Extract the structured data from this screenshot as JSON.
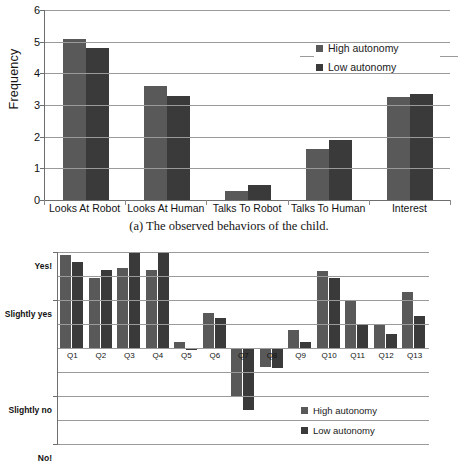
{
  "figure_a": {
    "caption": "(a) The observed behaviors of the child.",
    "ylabel": "Frequency",
    "yticks": [
      "6",
      "5",
      "4",
      "3",
      "2",
      "1",
      "0"
    ],
    "legend": [
      {
        "label": "High autonomy",
        "key": "high"
      },
      {
        "label": "Low autonomy",
        "key": "low"
      }
    ]
  },
  "figure_b": {
    "caption": "(b) The children’s answers on the questionnaire.",
    "yticks": [
      "Yes!",
      "Slightly yes",
      "Slightly no",
      "No!"
    ],
    "legend": [
      {
        "label": "High autonomy",
        "key": "high"
      },
      {
        "label": "Low autonomy",
        "key": "low"
      }
    ]
  },
  "chart_data": [
    {
      "type": "bar",
      "id": "observed-behaviors",
      "title": "(a) The observed behaviors of the child.",
      "xlabel": "",
      "ylabel": "Frequency",
      "ylim": [
        0,
        6
      ],
      "yticks": [
        0,
        1,
        2,
        3,
        4,
        5,
        6
      ],
      "grid": true,
      "legend_position": "top-right",
      "categories": [
        "Looks At Robot",
        "Looks At Human",
        "Talks To Robot",
        "Talks To Human",
        "Interest"
      ],
      "series": [
        {
          "name": "High autonomy",
          "color": "#595959",
          "values": [
            5.1,
            3.6,
            0.3,
            1.6,
            3.25
          ]
        },
        {
          "name": "Low autonomy",
          "color": "#3a3a3a",
          "values": [
            4.8,
            3.3,
            0.47,
            1.9,
            3.35
          ]
        }
      ]
    },
    {
      "type": "bar",
      "id": "questionnaire-answers",
      "title": "(b) The children’s answers on the questionnaire.",
      "xlabel": "",
      "ylabel": "",
      "ylim": [
        -3,
        3
      ],
      "ytick_values": [
        3,
        1.5,
        -1.5,
        -3
      ],
      "ytick_labels": [
        "Yes!",
        "Slightly yes",
        "Slightly no",
        "No!"
      ],
      "grid": true,
      "legend_position": "bottom-right",
      "categories": [
        "Q1",
        "Q2",
        "Q3",
        "Q4",
        "Q5",
        "Q6",
        "Q7",
        "Q8",
        "Q9",
        "Q10",
        "Q11",
        "Q12",
        "Q13"
      ],
      "series": [
        {
          "name": "High autonomy",
          "color": "#595959",
          "values": [
            2.9,
            2.2,
            2.5,
            2.45,
            0.2,
            1.1,
            -1.5,
            -0.6,
            0.55,
            2.4,
            1.5,
            0.75,
            1.75
          ]
        },
        {
          "name": "Low autonomy",
          "color": "#3a3a3a",
          "values": [
            2.7,
            2.45,
            3.0,
            3.0,
            -0.05,
            0.95,
            -1.95,
            -0.62,
            0.2,
            2.2,
            0.75,
            0.45,
            1.0
          ]
        }
      ]
    }
  ]
}
